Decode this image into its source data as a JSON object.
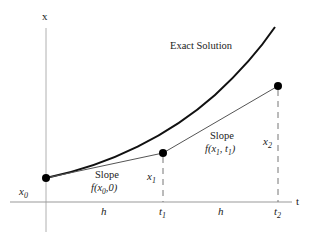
{
  "diagram": {
    "axes": {
      "x_axis_label": "x",
      "t_axis_label": "t"
    },
    "curve_label": "Exact Solution",
    "points": [
      {
        "name": "x0",
        "label": "x",
        "sub": "0"
      },
      {
        "name": "x1",
        "label": "x",
        "sub": "1"
      },
      {
        "name": "x2",
        "label": "x",
        "sub": "2"
      }
    ],
    "slopes": [
      {
        "title": "Slope",
        "expr_prefix": "f(x",
        "expr_sub": "0",
        "expr_suffix": ",0)"
      },
      {
        "title": "Slope",
        "expr_prefix": "f(x",
        "expr_sub": "1",
        "expr_mid": ", t",
        "expr_sub2": "1",
        "expr_suffix": ")"
      }
    ],
    "ticks": [
      {
        "label": "t",
        "sub": "1"
      },
      {
        "label": "t",
        "sub": "2"
      }
    ],
    "step_labels": [
      "h",
      "h"
    ],
    "colors": {
      "curve": "#111111",
      "axis": "#999999",
      "segment": "#555555",
      "dashed": "#777777",
      "points": "#000000"
    }
  }
}
